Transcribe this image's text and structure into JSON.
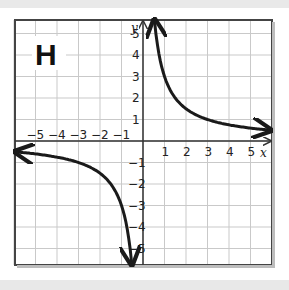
{
  "chart_data": {
    "type": "line",
    "title": "",
    "panel_label": "H",
    "xlabel": "x",
    "ylabel": "y",
    "xlim": [
      -6,
      6
    ],
    "ylim": [
      -5.7,
      5.6
    ],
    "grid": true,
    "x_tick_labels": [
      "−5",
      "−4",
      "−3",
      "−2",
      "−1",
      "1",
      "2",
      "3",
      "4",
      "5"
    ],
    "y_tick_labels": [
      "5",
      "4",
      "3",
      "2",
      "1",
      "−1",
      "−2",
      "−3",
      "−4",
      "−5"
    ],
    "function": "y = 3/x",
    "series": [
      {
        "name": "branch-positive",
        "x": [
          0.55,
          0.75,
          1,
          1.5,
          2,
          3,
          4,
          5,
          6
        ],
        "y": [
          5.5,
          4,
          3,
          2,
          1.5,
          1,
          0.75,
          0.6,
          0.5
        ]
      },
      {
        "name": "branch-negative",
        "x": [
          -6,
          -5,
          -4,
          -3,
          -2,
          -1.5,
          -1,
          -0.75,
          -0.55
        ],
        "y": [
          -0.5,
          -0.6,
          -0.75,
          -1,
          -1.5,
          -2,
          -3,
          -4,
          -5.5
        ]
      }
    ],
    "asymptotes": {
      "x": 0,
      "y": 0
    }
  },
  "colors": {
    "grid": "#c9c9c9",
    "frame": "#444444",
    "curve": "#1a1a1a",
    "background": "#ffffff"
  }
}
